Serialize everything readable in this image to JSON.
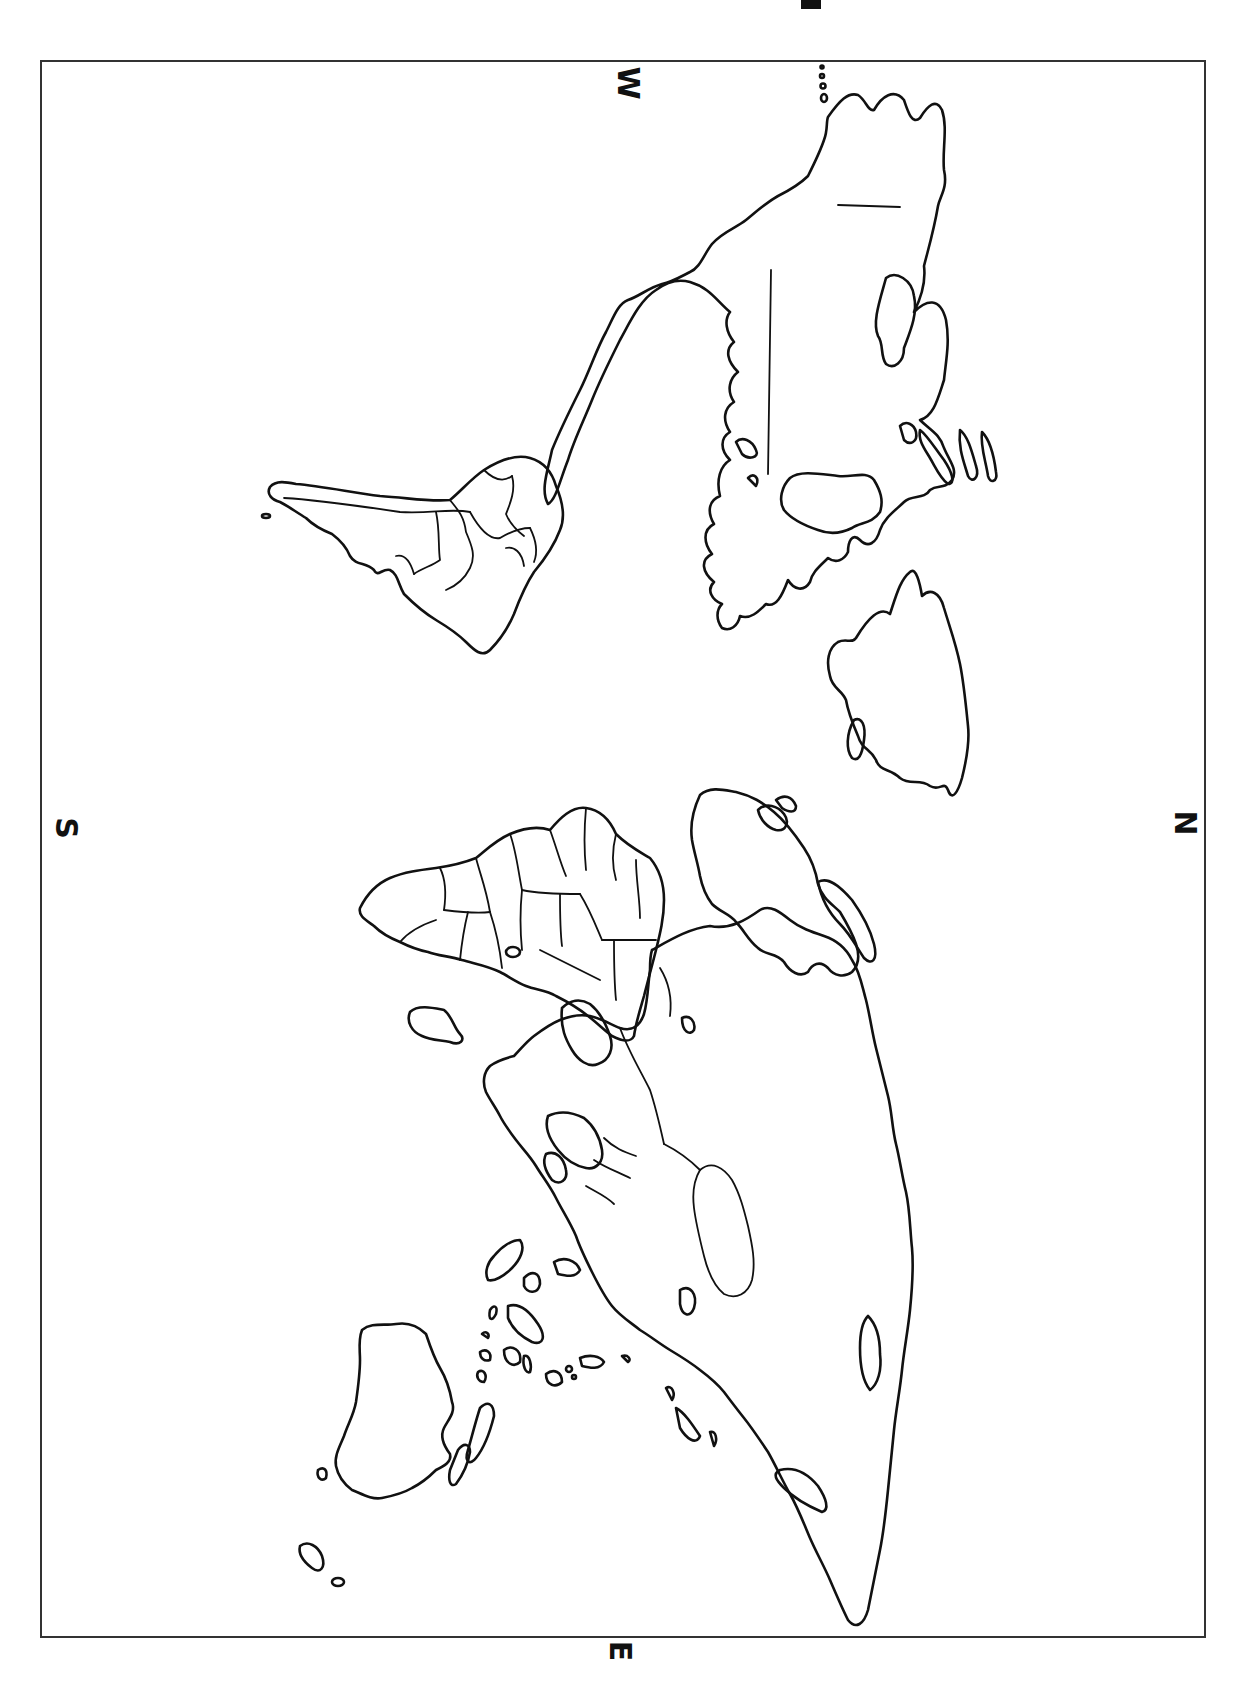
{
  "map": {
    "type": "world outline map (political boundaries)",
    "orientation": "rotated 90 degrees clockwise",
    "style": {
      "line_color": "#111111",
      "background": "#ffffff",
      "frame_color": "#333333"
    }
  },
  "compass": {
    "top": "W",
    "left": "S",
    "right": "N",
    "bottom": "E"
  },
  "regions": [
    {
      "name": "North America",
      "position": "upper-right"
    },
    {
      "name": "South America",
      "position": "upper-left"
    },
    {
      "name": "Greenland",
      "position": "right, middle-upper"
    },
    {
      "name": "Europe",
      "position": "center-right"
    },
    {
      "name": "Africa",
      "position": "center-left"
    },
    {
      "name": "Asia",
      "position": "lower-right"
    },
    {
      "name": "Australia",
      "position": "lower-left"
    }
  ]
}
